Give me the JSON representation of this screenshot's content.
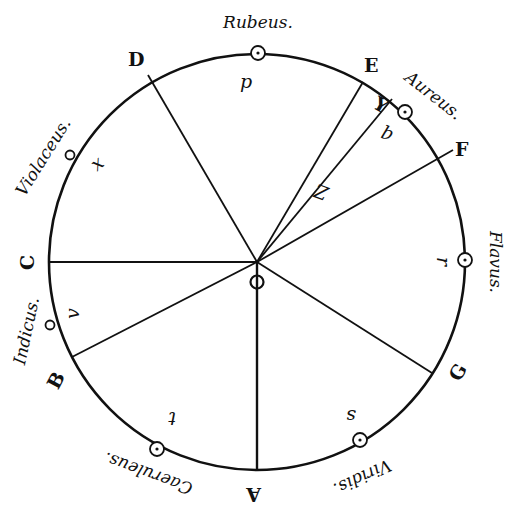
{
  "diagram": {
    "type": "color-circle",
    "stroke_color": "#111111",
    "background": "#ffffff",
    "circle": {
      "cx": 257,
      "cy": 262,
      "r": 208
    },
    "center_label": "O",
    "points": [
      {
        "id": "A",
        "label": "A",
        "x": 257,
        "y": 470,
        "lx": 247,
        "ly": 502,
        "rot": 180
      },
      {
        "id": "B",
        "label": "B",
        "x": 72,
        "y": 357,
        "lx": 48,
        "ly": 388,
        "rot": -62
      },
      {
        "id": "C",
        "label": "C",
        "x": 49,
        "y": 262,
        "lx": 20,
        "ly": 270,
        "rot": -90
      },
      {
        "id": "D",
        "label": "D",
        "x": 148,
        "y": 75,
        "lx": 128,
        "ly": 66,
        "rot": 0
      },
      {
        "id": "E",
        "label": "E",
        "x": 363,
        "y": 82,
        "lx": 364,
        "ly": 72,
        "rot": 0
      },
      {
        "id": "F",
        "label": "F",
        "x": 453,
        "y": 150,
        "lx": 455,
        "ly": 156,
        "rot": 0
      },
      {
        "id": "G",
        "label": "G",
        "x": 432,
        "y": 373,
        "lx": 450,
        "ly": 380,
        "rot": -60
      }
    ],
    "extra_line": {
      "label": "Y",
      "x": 392,
      "y": 99
    },
    "colors": [
      {
        "name": "Rubeus.",
        "x": 258,
        "y": 28,
        "rot": 0
      },
      {
        "name": "Aureus.",
        "x": 430,
        "y": 100,
        "rot": 38
      },
      {
        "name": "Flavus.",
        "x": 490,
        "y": 262,
        "rot": 90
      },
      {
        "name": "Viridis.",
        "x": 360,
        "y": 472,
        "rot": 155
      },
      {
        "name": "Caeruleus.",
        "x": 150,
        "y": 468,
        "rot": 200
      },
      {
        "name": "Indicus.",
        "x": 32,
        "y": 332,
        "rot": -78
      },
      {
        "name": "Violaceus.",
        "x": 48,
        "y": 160,
        "rot": -58
      }
    ],
    "gravity_centers": [
      {
        "letter": "p",
        "cx": 258,
        "cy": 53,
        "lx": 240,
        "ly": 88
      },
      {
        "letter": "q",
        "cx": 405,
        "cy": 112,
        "lx": 383,
        "ly": 142,
        "rot": 200
      },
      {
        "letter": "r",
        "cx": 465,
        "cy": 260,
        "lx": 438,
        "ly": 268,
        "rot": 90
      },
      {
        "letter": "s",
        "cx": 360,
        "cy": 440,
        "lx": 346,
        "ly": 422,
        "rot": 180
      },
      {
        "letter": "t",
        "cx": 157,
        "cy": 449,
        "lx": 166,
        "ly": 424,
        "rot": 180
      },
      {
        "letter": "v",
        "cx": 50,
        "cy": 325,
        "lx": 68,
        "ly": 320,
        "rot": -90
      },
      {
        "letter": "x",
        "cx": 70,
        "cy": 155,
        "lx": 92,
        "ly": 170,
        "rot": -40
      }
    ],
    "z_marker": {
      "letter": "Z",
      "x": 318,
      "y": 198
    }
  }
}
